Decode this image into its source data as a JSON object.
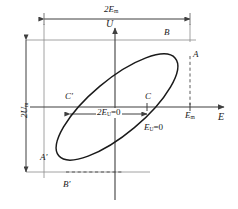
{
  "figure": {
    "type": "ellipse-lissajous-diagram",
    "title": "",
    "axes": {
      "vertical_label": "U",
      "horizontal_label": "E",
      "vertical_arrow": "up",
      "horizontal_arrow": "right"
    },
    "dimensions": [
      {
        "name": "total-horizontal-span",
        "text_main": "2E",
        "text_sub": "m",
        "orientation": "horizontal",
        "position": "top"
      },
      {
        "name": "total-vertical-span",
        "text_main": "2U",
        "text_sub": "m",
        "orientation": "vertical",
        "position": "left"
      },
      {
        "name": "inner-horizontal-span",
        "text_main": "2E",
        "text_sub": "U",
        "text_tail": "=0",
        "orientation": "horizontal",
        "position": "center"
      }
    ],
    "tick_labels": [
      {
        "name": "em-tick",
        "text_main": "E",
        "text_sub": "m"
      },
      {
        "name": "eu-zero-tick",
        "text_main": "E",
        "text_sub": "U",
        "text_tail": "=0"
      }
    ],
    "points": [
      {
        "name": "point-A",
        "label": "A",
        "x": 193,
        "y": 56
      },
      {
        "name": "point-B",
        "label": "B",
        "x": 166,
        "y": 34
      },
      {
        "name": "point-C",
        "label": "C",
        "x": 147,
        "y": 98
      },
      {
        "name": "point-Cp",
        "label": "C'",
        "x": 68,
        "y": 98
      },
      {
        "name": "point-Ap",
        "label": "A'",
        "x": 43,
        "y": 158
      },
      {
        "name": "point-Bp",
        "label": "B'",
        "x": 65,
        "y": 186
      }
    ],
    "geometry": {
      "origin": {
        "x": 115,
        "y": 107
      },
      "ellipse": {
        "cx": 117,
        "cy": 107,
        "rx": 76,
        "ry": 27,
        "rotation_deg": -40
      },
      "axis_color": "#3f3f3f",
      "curve_color": "#1a1a1a",
      "dash_color": "#4a4a4a",
      "em_x": 190,
      "minus_em_x": 44,
      "top_y": 40,
      "bottom_y": 172
    }
  }
}
